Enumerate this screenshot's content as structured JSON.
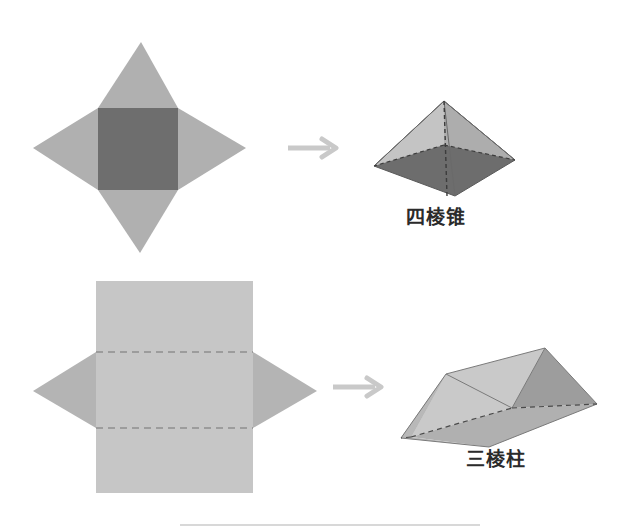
{
  "page": {
    "background": "#ffffff",
    "width": 629,
    "height": 529
  },
  "palette": {
    "star_triangle": "#b0b0b0",
    "star_square": "#6e6e6e",
    "prism_net_body": "#c6c6c6",
    "prism_net_triangle": "#b4b4b4",
    "fold_line": "#8e8e8e",
    "arrow": "#c9c9c9",
    "solid_light": "#c9c9c9",
    "solid_mid": "#b3b3b3",
    "solid_dark": "#6d6d6d",
    "solid_face": "#9d9d9d",
    "label_text": "#2b2b2b",
    "edge_dash": "#4a4a4a"
  },
  "rows": [
    {
      "id": "row-pyramid",
      "net": {
        "name": "square-pyramid-net",
        "description": "四棱锥展开图",
        "shape": "four-pointed-star",
        "square": {
          "x": 98,
          "y": 108,
          "w": 80,
          "h": 82
        },
        "tips": {
          "top": {
            "x": 141,
            "y": 42
          },
          "left": {
            "x": 33,
            "y": 148
          },
          "right": {
            "x": 246,
            "y": 148
          },
          "bottom": {
            "x": 140,
            "y": 253
          }
        }
      },
      "arrow": {
        "name": "transform-arrow",
        "x": 288,
        "y": 148,
        "length": 48,
        "direction": "right"
      },
      "solid": {
        "name": "square-pyramid",
        "label": "四棱锥",
        "label_pinyin": "si leng zhui",
        "hidden_edges": "dashed"
      }
    },
    {
      "id": "row-prism",
      "net": {
        "name": "triangular-prism-net",
        "description": "三棱柱展开图",
        "shape": "rectangle-with-two-side-triangles",
        "rectangle": {
          "x": 96,
          "y": 281,
          "w": 157,
          "h": 212
        },
        "fold_lines": [
          {
            "y": 352,
            "style": "dashed"
          },
          {
            "y": 428,
            "style": "dashed"
          }
        ],
        "left_triangle": {
          "apex_x": 33,
          "apex_y": 391,
          "top_y": 352,
          "bottom_y": 428
        },
        "right_triangle": {
          "apex_x": 317,
          "apex_y": 391,
          "top_y": 352,
          "bottom_y": 428
        }
      },
      "arrow": {
        "name": "transform-arrow",
        "x": 333,
        "y": 387,
        "length": 48,
        "direction": "right"
      },
      "solid": {
        "name": "triangular-prism",
        "label": "三棱柱",
        "label_pinyin": "san leng zhu",
        "hidden_edges": "dashed"
      }
    }
  ]
}
